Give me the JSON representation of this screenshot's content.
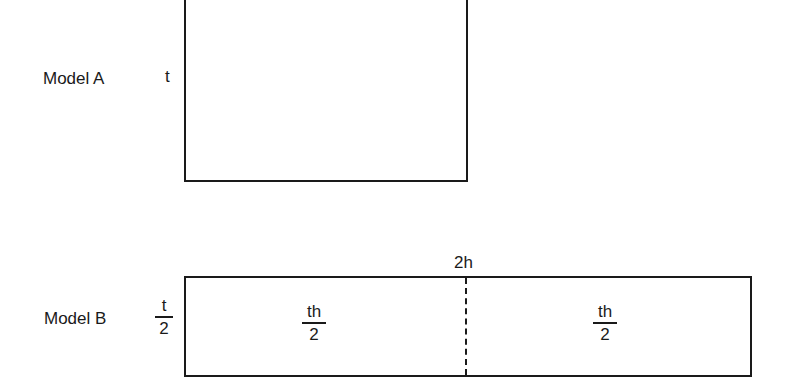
{
  "model_a": {
    "label": "Model A",
    "side_label": "t"
  },
  "model_b": {
    "label": "Model B",
    "side_label": {
      "numerator": "t",
      "denominator": "2"
    },
    "top_label": "2h",
    "left_half": {
      "numerator": "th",
      "denominator": "2"
    },
    "right_half": {
      "numerator": "th",
      "denominator": "2"
    }
  },
  "colors": {
    "line": "#1a1a1a",
    "background": "#ffffff"
  }
}
